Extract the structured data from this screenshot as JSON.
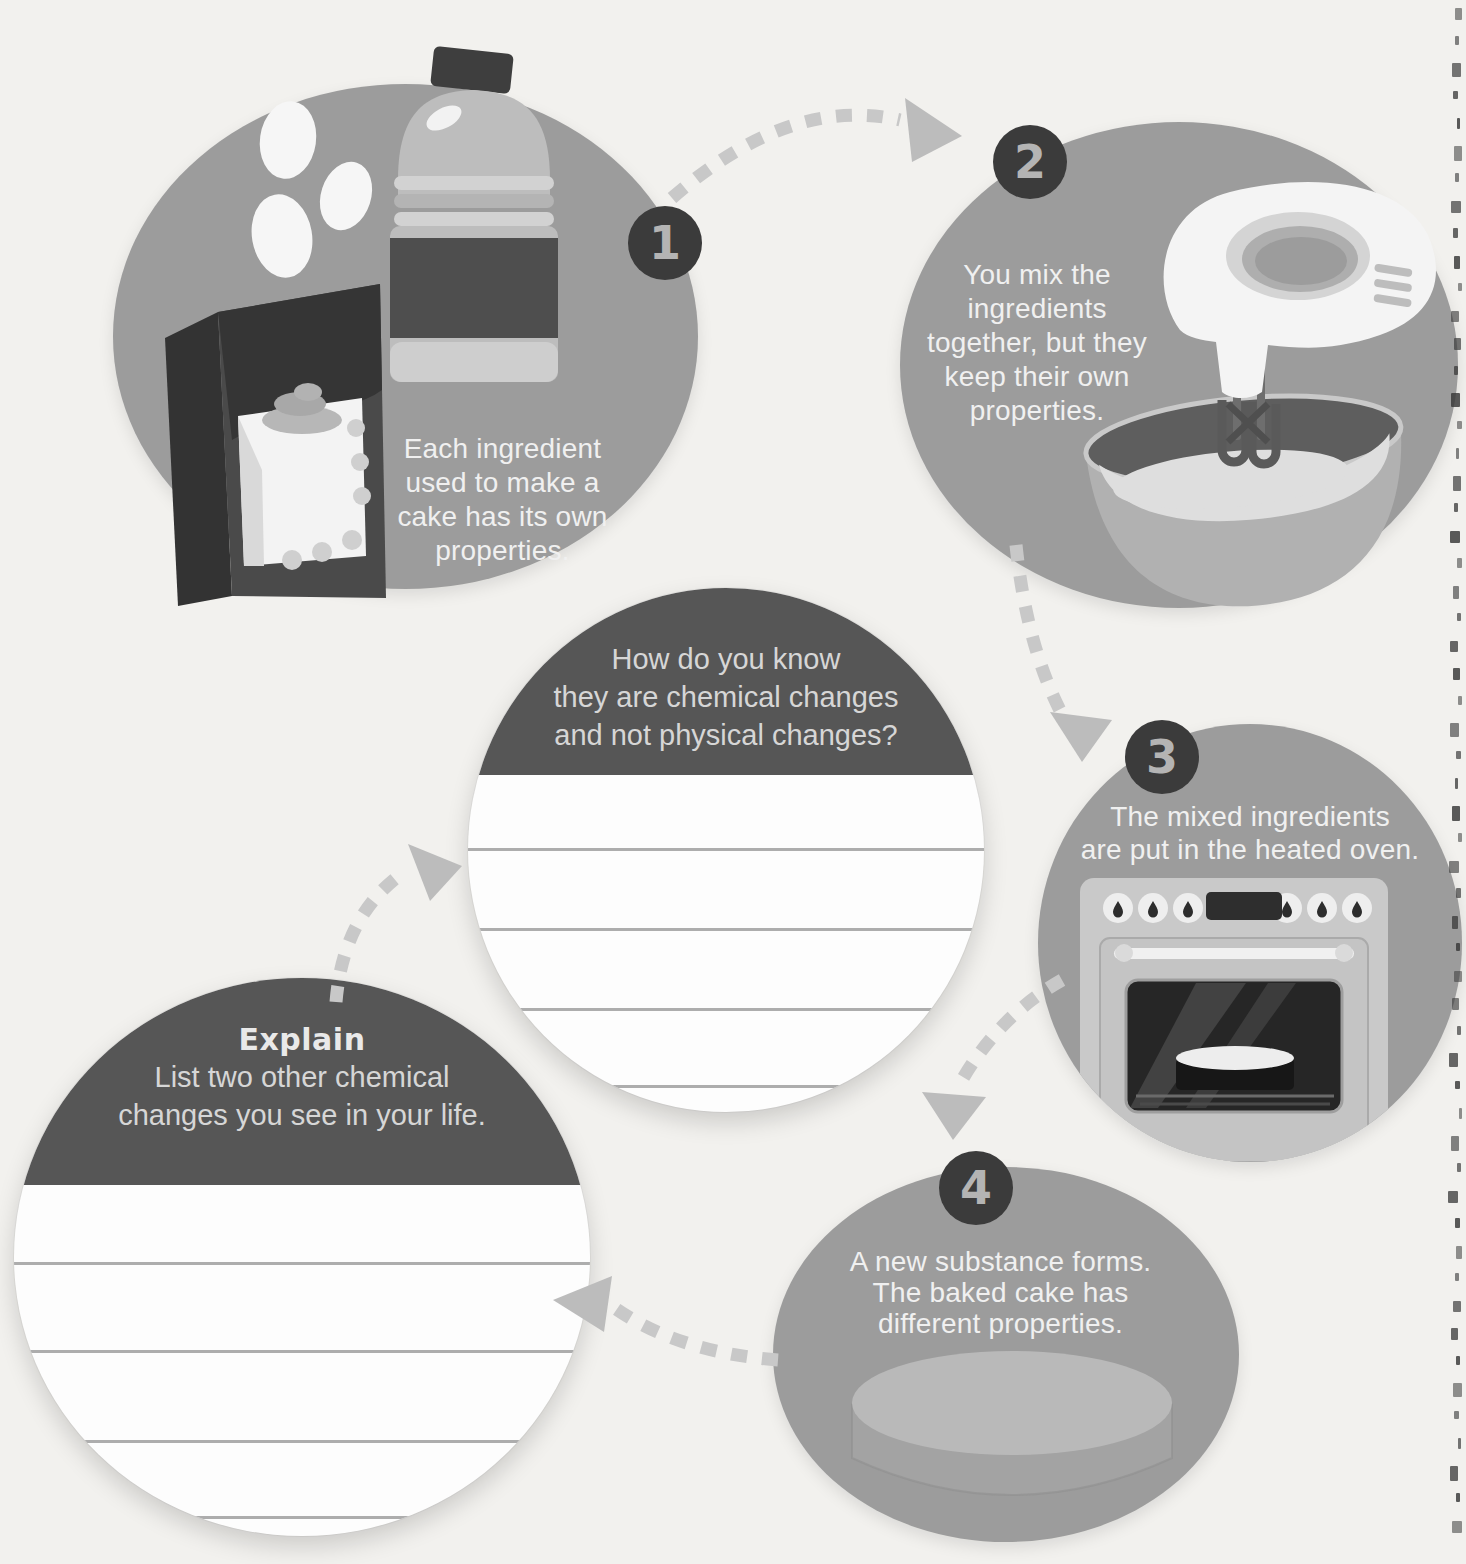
{
  "page": {
    "description": "Science workbook diagram page: chemical changes shown through baking a cake",
    "background_color": "#f2f1ee"
  },
  "colors": {
    "bubble_gray": "#9c9c9c",
    "header_dark": "#565656",
    "badge_dark": "#3b3b3b",
    "badge_number": "#b4b4b4",
    "bubble_text": "#f0f0f0",
    "header_text": "#d6d6d6",
    "arrow_dash": "#c8c8c8",
    "arrowhead": "#bcbcbc",
    "writing_line": "#9f9f9f"
  },
  "steps": [
    {
      "number": "1",
      "lines": [
        "Each ingredient",
        "used to make a",
        "cake has its own",
        "properties."
      ],
      "illustration": "cake-ingredients: eggs, oil bottle, cake-mix box"
    },
    {
      "number": "2",
      "lines": [
        "You mix the",
        "ingredients",
        "together, but they",
        "keep their own",
        "properties."
      ],
      "illustration": "hand mixer beating batter in a bowl"
    },
    {
      "number": "3",
      "lines": [
        "The mixed ingredients",
        "are put in the heated oven."
      ],
      "illustration": "oven with cake pan inside"
    },
    {
      "number": "4",
      "lines": [
        "A new substance forms.",
        "The baked cake has",
        "different properties."
      ],
      "illustration": "baked round cake"
    }
  ],
  "question_bubble": {
    "prompt_lines": [
      "How do you know",
      "they are chemical changes",
      "and not physical changes?"
    ],
    "writing_lines": 4
  },
  "explain_bubble": {
    "heading": "Explain",
    "prompt_lines": [
      "List two other chemical",
      "changes you see in your life."
    ],
    "writing_lines": 4
  },
  "page_edge": {
    "binding_marks": 56
  }
}
